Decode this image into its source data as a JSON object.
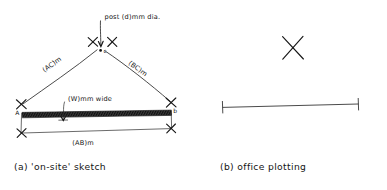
{
  "figure": {
    "kind": "hand-drawn surveying sketch",
    "panels": [
      {
        "id": "a",
        "caption": "(a) 'on-site' sketch",
        "labels": {
          "post": "post (d)mm dia.",
          "left_side": "(AC)m",
          "right_side": "(BC)m",
          "baseline": "(AB)m",
          "wall_width": "(W)mm wide",
          "point_a": "A",
          "point_b": "b",
          "point_c": "c"
        }
      },
      {
        "id": "b",
        "caption": "(b) office plotting",
        "labels": {}
      }
    ]
  },
  "colors": {
    "ink": "#1a1a1a",
    "line": "#2b2b2b",
    "hatch": "#2a2a2a",
    "paper": "#ffffff"
  }
}
